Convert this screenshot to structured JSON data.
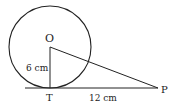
{
  "diagram": {
    "type": "geometry-circle-tangent",
    "circle": {
      "center_label": "O",
      "cx": 50,
      "cy": 47,
      "r": 41
    },
    "points": {
      "O": {
        "label": "O",
        "x": 50,
        "y": 47
      },
      "T": {
        "label": "T",
        "x": 50,
        "y": 88
      },
      "P": {
        "label": "P",
        "x": 158,
        "y": 88
      }
    },
    "segments": [
      {
        "from": "O",
        "to": "T",
        "label": "6 cm"
      },
      {
        "from": "T",
        "to": "P",
        "label": "12 cm"
      },
      {
        "from": "O",
        "to": "P",
        "label": ""
      }
    ],
    "labels": {
      "O": "O",
      "T": "T",
      "P": "P",
      "OT": "6 cm",
      "TP": "12 cm"
    },
    "colors": {
      "stroke": "#222222",
      "background": "#ffffff"
    }
  }
}
